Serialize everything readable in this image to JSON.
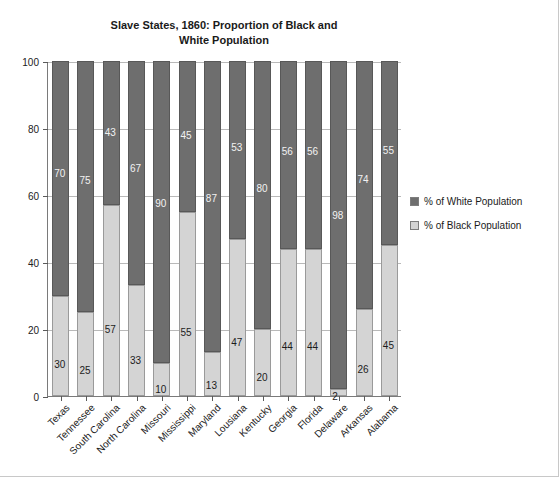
{
  "chart_data": {
    "type": "bar",
    "subtype": "stacked-percentage",
    "title": "Slave States, 1860: Proportion of Black and\nWhite Population",
    "xlabel": "",
    "ylabel": "",
    "ylim": [
      0,
      100
    ],
    "yticks": [
      0,
      20,
      40,
      60,
      80,
      100
    ],
    "ytick_labels": [
      "0",
      "20",
      "40",
      "60",
      "80",
      "100"
    ],
    "grid": true,
    "legend_position": "right",
    "categories": [
      "Texas",
      "Tennessee",
      "South Carolina",
      "North Carolina",
      "Missouri",
      "Mississippi",
      "Maryland",
      "Lousiana",
      "Kentucky",
      "Georgia",
      "Florida",
      "Delaware",
      "Arkansas",
      "Alabama"
    ],
    "series": [
      {
        "name": "% of White Population",
        "color": "#6e6e6e",
        "values": [
          70,
          75,
          43,
          67,
          90,
          45,
          87,
          53,
          80,
          56,
          56,
          98,
          74,
          55
        ]
      },
      {
        "name": "% of Black Population",
        "color": "#d4d4d4",
        "values": [
          30,
          25,
          57,
          33,
          10,
          55,
          13,
          47,
          20,
          44,
          44,
          2,
          26,
          45
        ]
      }
    ]
  },
  "legend": {
    "items": [
      {
        "label": "% of White Population",
        "swatch": "white-pop"
      },
      {
        "label": "% of Black Population",
        "swatch": "black-pop"
      }
    ]
  }
}
